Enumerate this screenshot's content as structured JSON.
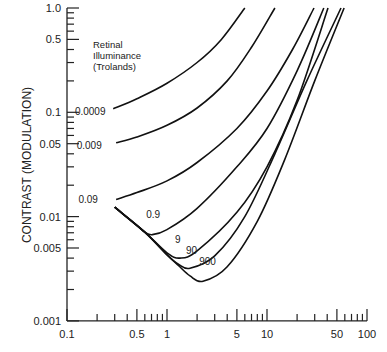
{
  "chart_data": {
    "type": "line",
    "title": "",
    "xlabel": "",
    "ylabel": "CONTRAST (MODULATION)",
    "xscale": "log",
    "yscale": "log",
    "xlim": [
      0.1,
      100
    ],
    "ylim": [
      0.001,
      1.0
    ],
    "grid": false,
    "x_tick_labels": [
      "0.1",
      "0.5",
      "1",
      "5",
      "10",
      "50",
      "100"
    ],
    "y_tick_labels": [
      "0.001",
      "0.005",
      "0.01",
      "0.05",
      "0.1",
      "0.5",
      "1.0"
    ],
    "legend_title": [
      "Retinal",
      "Illuminance",
      "(Trolands)"
    ],
    "series": [
      {
        "name": "0.0009",
        "points": [
          [
            0.29,
            0.108
          ],
          [
            0.5,
            0.135
          ],
          [
            1,
            0.19
          ],
          [
            2,
            0.3
          ],
          [
            3.5,
            0.5
          ],
          [
            6,
            1.0
          ]
        ]
      },
      {
        "name": "0.009",
        "points": [
          [
            0.31,
            0.051
          ],
          [
            0.5,
            0.058
          ],
          [
            1,
            0.075
          ],
          [
            2,
            0.11
          ],
          [
            4,
            0.2
          ],
          [
            7,
            0.42
          ],
          [
            12,
            1.0
          ]
        ]
      },
      {
        "name": "0.09",
        "points": [
          [
            0.31,
            0.0146
          ],
          [
            0.5,
            0.017
          ],
          [
            1,
            0.022
          ],
          [
            2,
            0.033
          ],
          [
            5,
            0.07
          ],
          [
            10,
            0.16
          ],
          [
            18,
            0.4
          ],
          [
            29.5,
            1.0
          ]
        ]
      },
      {
        "name": "0.9",
        "points": [
          [
            0.3,
            0.0123
          ],
          [
            0.5,
            0.0082
          ],
          [
            0.6,
            0.0071
          ],
          [
            0.71,
            0.0067
          ],
          [
            1,
            0.0075
          ],
          [
            2,
            0.012
          ],
          [
            5,
            0.03
          ],
          [
            10,
            0.07
          ],
          [
            20,
            0.25
          ],
          [
            37,
            1.0
          ]
        ]
      },
      {
        "name": "9",
        "points": [
          [
            0.3,
            0.0123
          ],
          [
            0.6,
            0.0071
          ],
          [
            1,
            0.0045
          ],
          [
            1.35,
            0.004
          ],
          [
            2,
            0.0047
          ],
          [
            5,
            0.011
          ],
          [
            10,
            0.03
          ],
          [
            20,
            0.13
          ],
          [
            40.7,
            1.0
          ]
        ]
      },
      {
        "name": "90",
        "points": [
          [
            0.3,
            0.0123
          ],
          [
            0.6,
            0.0071
          ],
          [
            1,
            0.0043
          ],
          [
            1.3,
            0.0035
          ],
          [
            1.7,
            0.0032
          ],
          [
            3,
            0.0042
          ],
          [
            6,
            0.01
          ],
          [
            12,
            0.04
          ],
          [
            25,
            0.2
          ],
          [
            55,
            1.0
          ]
        ]
      },
      {
        "name": "900",
        "points": [
          [
            0.3,
            0.0123
          ],
          [
            0.6,
            0.0071
          ],
          [
            1,
            0.0043
          ],
          [
            1.3,
            0.0034
          ],
          [
            1.7,
            0.0027
          ],
          [
            2.29,
            0.0024
          ],
          [
            4,
            0.0033
          ],
          [
            8,
            0.009
          ],
          [
            15,
            0.035
          ],
          [
            30,
            0.2
          ],
          [
            59,
            1.0
          ]
        ]
      }
    ],
    "curve_labels": [
      {
        "text": "0.0009",
        "x": 0.12,
        "y": 0.095
      },
      {
        "text": "0.009",
        "x": 0.125,
        "y": 0.044
      },
      {
        "text": "0.09",
        "x": 0.13,
        "y": 0.0135
      },
      {
        "text": "0.9",
        "x": 0.62,
        "y": 0.0098
      },
      {
        "text": "9",
        "x": 1.2,
        "y": 0.0056
      },
      {
        "text": "90",
        "x": 1.55,
        "y": 0.0044
      },
      {
        "text": "900",
        "x": 2.1,
        "y": 0.0034
      }
    ]
  }
}
